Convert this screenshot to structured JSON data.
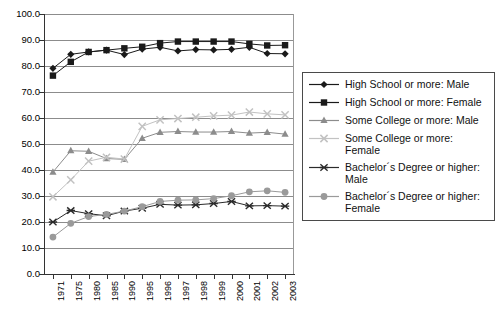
{
  "chart_data": {
    "type": "line",
    "title": "",
    "xlabel": "",
    "ylabel": "",
    "ylim": [
      0,
      100
    ],
    "ytick_step": 10,
    "grid": true,
    "legend_position": "right",
    "categories": [
      "1971",
      "1975",
      "1980",
      "1985",
      "1990",
      "1995",
      "1996",
      "1997",
      "1998",
      "1999",
      "2000",
      "2001",
      "2002",
      "2003"
    ],
    "ytick_labels": [
      "100.0",
      "90.0",
      "80.0",
      "70.0",
      "60.0",
      "50.0",
      "40.0",
      "30.0",
      "20.0",
      "10.0",
      "0.0"
    ],
    "series": [
      {
        "name": "High School or more: Male",
        "marker": "diamond",
        "color": "#1a1a1a",
        "values": [
          79.1,
          84.5,
          85.4,
          86.1,
          84.4,
          86.5,
          87.2,
          85.8,
          86.3,
          86.2,
          86.4,
          87.2,
          84.8,
          84.7
        ]
      },
      {
        "name": "High School or more: Female",
        "marker": "square",
        "color": "#1a1a1a",
        "values": [
          76.3,
          81.6,
          85.4,
          86.1,
          86.8,
          87.4,
          88.8,
          89.4,
          89.4,
          89.4,
          89.4,
          88.5,
          87.9,
          88.0
        ]
      },
      {
        "name": "Some College or more: Male",
        "marker": "triangle",
        "color": "#8c8c8c",
        "values": [
          39.2,
          47.4,
          47.2,
          44.4,
          44.1,
          52.2,
          54.5,
          54.8,
          54.6,
          54.6,
          54.8,
          54.2,
          54.5,
          53.8
        ]
      },
      {
        "name": "Some College or more: Female",
        "marker": "cross",
        "color": "#c2c2c2",
        "values": [
          29.7,
          36.2,
          43.4,
          44.9,
          44.2,
          56.8,
          59.3,
          59.8,
          60.3,
          60.8,
          61.1,
          62.3,
          61.6,
          61.2
        ]
      },
      {
        "name": "Bachelor´s Degree or higher:\nMale",
        "marker": "asterisk",
        "color": "#2b2b2b",
        "values": [
          20.0,
          24.4,
          23.2,
          22.4,
          24.2,
          25.3,
          26.8,
          26.5,
          26.6,
          27.1,
          27.9,
          26.2,
          26.3,
          26.1
        ]
      },
      {
        "name": "Bachelor´s Degree or higher:\nFemale",
        "marker": "circle",
        "color": "#9a9a9a",
        "values": [
          14.2,
          19.5,
          22.1,
          22.9,
          24.2,
          25.9,
          27.9,
          28.4,
          28.5,
          29.0,
          30.1,
          31.6,
          32.0,
          31.4
        ]
      }
    ]
  }
}
